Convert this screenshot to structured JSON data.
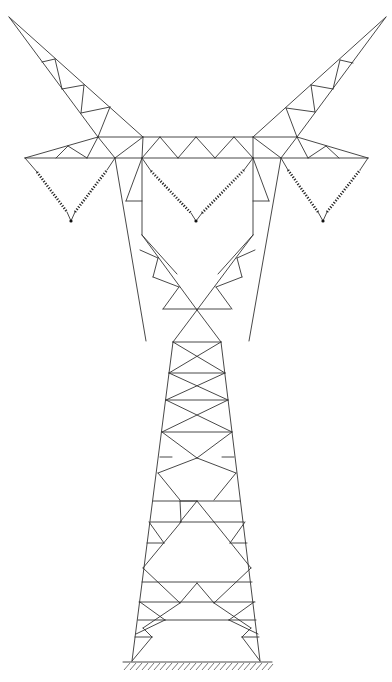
{
  "diagram": {
    "subject": "Electricity transmission tower (lattice pylon) line drawing",
    "colors": {
      "background": "#ffffff",
      "line": "#333333",
      "insulator": "#222222"
    },
    "parts": {
      "left_arm": "left ground-wire peak",
      "right_arm": "right ground-wire peak",
      "crossarm": "horizontal truss crossarm",
      "insulators": [
        "left V-string insulator",
        "center V-string insulator",
        "right V-string insulator"
      ],
      "waist": "X-shaped waist",
      "body": "tapered lattice body",
      "ground": "hatched ground line"
    }
  }
}
